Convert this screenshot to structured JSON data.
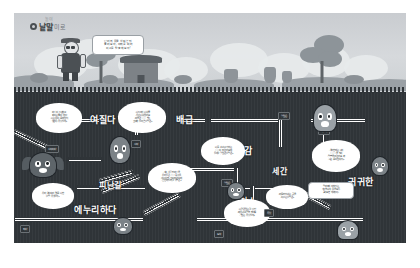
{
  "page": {
    "background": "#ffffff",
    "card_background": "#cfd3d6",
    "sky_color": "#d0d4d7",
    "underground_color": "#2f3438",
    "pipe_color": "#e9ecee",
    "label_color": "#ffffff"
  },
  "logo": {
    "mark": "circle-mark-icon",
    "name": "낱말",
    "subtitle": "미로",
    "superscript": "놀이"
  },
  "intro_bubble": {
    "text": "단어의 뜻을 살펴본 뒤\n풀어 보자, 아래를 따라\n미로를 탈출해 보자!"
  },
  "scenery": {
    "character": "farmer-with-glasses",
    "items": [
      "house",
      "trees",
      "clouds",
      "jars",
      "rocks",
      "hills"
    ]
  },
  "keywords": [
    {
      "id": "yeojilda",
      "text": "여질다",
      "x": 91,
      "y": 107,
      "size": 9
    },
    {
      "id": "baegeup",
      "text": "배급",
      "x": 177,
      "y": 107,
      "size": 9
    },
    {
      "id": "jajongam",
      "text": "자존감",
      "x": 232,
      "y": 137,
      "size": 9
    },
    {
      "id": "segan",
      "text": "세간",
      "x": 276,
      "y": 158,
      "size": 8
    },
    {
      "id": "gwigwihan",
      "text": "귀귀한",
      "x": 352,
      "y": 168,
      "size": 9
    },
    {
      "id": "pinangil",
      "text": "피난길",
      "x": 100,
      "y": 172,
      "size": 8
    },
    {
      "id": "enurihada",
      "text": "에누리하다",
      "x": 80,
      "y": 196,
      "size": 9
    },
    {
      "id": "cheoso",
      "text": "처소",
      "x": 243,
      "y": 188,
      "size": 8
    }
  ],
  "bubbles": [
    {
      "id": "b1",
      "x": 40,
      "y": 96,
      "w": 46,
      "h": 30,
      "lines": [
        "바탕이 느슨하고",
        "짜이는 줄이 없다",
        "'나는 옷이 몸에 맞지",
        "않았다' 무엇일까?"
      ]
    },
    {
      "id": "b2",
      "x": 122,
      "y": 96,
      "w": 48,
      "h": 31,
      "lines": [
        "'나누어서 나눠줌",
        "'우린 나눠줬어요",
        "'마을은 ○○○ 받는",
        "것이라 돌아온 낱말은?"
      ]
    },
    {
      "id": "b3",
      "x": 205,
      "y": 130,
      "w": 44,
      "h": 28,
      "lines": [
        "'나를 스스로가 하는",
        "○○○이 되었어요'에",
        "들어갈 알맞은 낱말은?"
      ]
    },
    {
      "id": "b4",
      "x": 316,
      "y": 133,
      "w": 48,
      "h": 32,
      "lines": [
        "'우리한테는 나의",
        "○○○○을 빌려",
        "'말씀을 주었어요' 와",
        "'나는 몸이 맞춰지?"
      ]
    },
    {
      "id": "b5",
      "x": 152,
      "y": 156,
      "w": 48,
      "h": 30,
      "lines": [
        "'새로 살림 밑바탕을",
        "'우리들은 ○○○를 사용",
        "'새로이 한 것이 되었다'에",
        "'안전하 들어갈 낱말은?"
      ]
    },
    {
      "id": "b6",
      "x": 36,
      "y": 176,
      "w": 42,
      "h": 26,
      "lines": [
        "'우리 역사소리 몇 몸 나한",
        "'낱말 무엇일까?"
      ]
    },
    {
      "id": "b7",
      "x": 228,
      "y": 192,
      "w": 46,
      "h": 28,
      "lines": [
        "'나랑은 맞는걸 멋진",
        "'배우려고 공부 했어요",
        "'알맞는 무엇일까?"
      ]
    },
    {
      "id": "b8",
      "x": 270,
      "y": 178,
      "w": 42,
      "h": 24,
      "lines": [
        "'머물러 지내는 곳'을",
        "'이르는 낱말은?"
      ]
    }
  ],
  "info_box": {
    "x": 312,
    "y": 175,
    "w": 46,
    "h": 17,
    "lines": [
      "말머리에 적혀있는",
      "가로열쇠의 뜻을 모두",
      "풀어보면 재미있다!"
    ]
  },
  "tags": [
    {
      "id": "t1",
      "text": "시작이다",
      "x": 49,
      "y": 138
    },
    {
      "id": "t2",
      "text": "시작",
      "x": 135,
      "y": 133
    },
    {
      "id": "t3",
      "text": "알맞은",
      "x": 282,
      "y": 105
    },
    {
      "id": "t4",
      "text": "이르다",
      "x": 322,
      "y": 120
    },
    {
      "id": "t5",
      "text": "알맞은",
      "x": 225,
      "y": 172
    },
    {
      "id": "t6",
      "text": "무엇",
      "x": 268,
      "y": 202
    },
    {
      "id": "t7",
      "text": "도착",
      "x": 218,
      "y": 223
    },
    {
      "id": "t8",
      "text": "되다",
      "x": 24,
      "y": 218
    }
  ],
  "creatures": [
    {
      "id": "c1",
      "kind": "bat",
      "x": 34,
      "y": 146,
      "w": 26,
      "h": 24
    },
    {
      "id": "c2",
      "kind": "stand",
      "x": 114,
      "y": 130,
      "w": 20,
      "h": 26
    },
    {
      "id": "c3",
      "kind": "ghost",
      "x": 318,
      "y": 98,
      "w": 22,
      "h": 26
    },
    {
      "id": "c4",
      "kind": "stand",
      "x": 232,
      "y": 176,
      "w": 16,
      "h": 16
    },
    {
      "id": "c5",
      "kind": "stand",
      "x": 118,
      "y": 211,
      "w": 18,
      "h": 16
    },
    {
      "id": "c6",
      "kind": "ghost",
      "x": 342,
      "y": 214,
      "w": 20,
      "h": 18
    },
    {
      "id": "c7",
      "kind": "stand",
      "x": 376,
      "y": 150,
      "w": 16,
      "h": 18
    }
  ]
}
